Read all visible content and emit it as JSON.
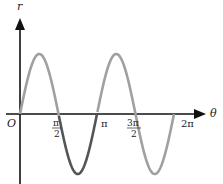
{
  "chart_data": {
    "type": "line",
    "title": "",
    "function": "r = sin(2θ)",
    "xlabel": "θ",
    "ylabel": "r",
    "origin_label": "O",
    "xlim": [
      0,
      6.2832
    ],
    "ylim": [
      -1,
      1
    ],
    "grid": false,
    "legend": null,
    "x_ticks": [
      {
        "value": 1.5708,
        "label_num": "π",
        "label_den": "2"
      },
      {
        "value": 3.1416,
        "label": "π"
      },
      {
        "value": 4.7124,
        "label_num": "3π",
        "label_den": "2"
      },
      {
        "value": 6.2832,
        "label": "2π"
      }
    ],
    "series": [
      {
        "name": "r = sin 2θ",
        "color": "#a0a0a0",
        "x": [
          0,
          0.7854,
          1.5708,
          2.3562,
          3.1416,
          3.927,
          4.7124,
          5.4978,
          6.2832
        ],
        "y": [
          0,
          1,
          0,
          -1,
          0,
          1,
          0,
          -1,
          0
        ]
      }
    ],
    "highlight": {
      "description": "segment from π/2 to π drawn darker",
      "range": [
        1.5708,
        3.1416
      ],
      "color": "#555555"
    }
  },
  "labels": {
    "r": "r",
    "theta": "θ",
    "origin": "O",
    "pi_half_num": "π",
    "pi_half_den": "2",
    "pi": "π",
    "three_pi_half_num": "3π",
    "three_pi_half_den": "2",
    "two_pi": "2π"
  }
}
